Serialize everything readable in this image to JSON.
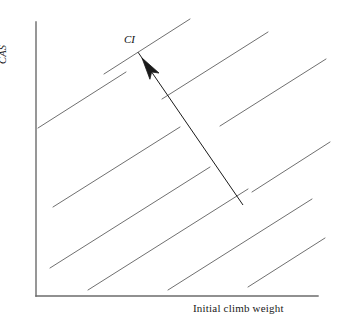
{
  "figure": {
    "background_color": "#ffffff",
    "width": 338,
    "height": 321
  },
  "axes": {
    "color": "#6b6b6b",
    "origin_x": 36,
    "origin_y": 296,
    "y_top": 22,
    "x_right": 318,
    "x_title": "Initial climb weight",
    "y_title": "CAS"
  },
  "annotation": {
    "label": "CI",
    "arrow_color": "#1a1a1a",
    "arrow_tail_x": 243,
    "arrow_tail_y": 205,
    "arrow_head_x": 142,
    "arrow_head_y": 58
  },
  "chart_data": {
    "type": "line",
    "title": "",
    "xlabel": "Initial climb weight",
    "ylabel": "CAS",
    "annotations": [
      {
        "text": "CI",
        "meaning": "arrow indicates direction of increasing Cost Index",
        "arrow_from": [
          243,
          205
        ],
        "arrow_to": [
          142,
          58
        ]
      }
    ],
    "grid": false,
    "legend": false,
    "axis_ticks": false,
    "xlim": [
      0,
      1
    ],
    "ylim": [
      0,
      1
    ],
    "series_description": "family of eight parallel straight lines of equal positive slope, each representing a constant Cost Index (CI); CI increases toward the upper-left along the arrow",
    "line_color": "#707070",
    "line_slope": -0.632,
    "series": [
      {
        "name": "CI line 1",
        "x": [
          38,
          125
        ],
        "y": [
          129,
          74
        ]
      },
      {
        "name": "CI line 2",
        "x": [
          48,
          178
        ],
        "y": [
          210,
          128
        ]
      },
      {
        "name": "CI line 3",
        "x": [
          54,
          205
        ],
        "y": [
          270,
          175
        ]
      },
      {
        "name": "CI line 4",
        "x": [
          88,
          243
        ],
        "y": [
          288,
          190
        ]
      },
      {
        "name": "CI line 5",
        "x": [
          119,
          300
        ],
        "y": [
          77,
          22
        ]
      },
      {
        "name": "CI line 6",
        "x": [
          168,
          311
        ],
        "y": [
          288,
          200
        ]
      },
      {
        "name": "CI line 7",
        "x": [
          200,
          325
        ],
        "y": [
          40,
          22
        ]
      },
      {
        "name": "CI line 8",
        "x": [
          248,
          324
        ],
        "y": [
          285,
          237
        ]
      }
    ],
    "lines_px": [
      {
        "x1": 38,
        "y1": 128,
        "x2": 126,
        "y2": 72
      },
      {
        "x1": 53,
        "y1": 207,
        "x2": 180,
        "y2": 127
      },
      {
        "x1": 50,
        "y1": 268,
        "x2": 210,
        "y2": 167
      },
      {
        "x1": 88,
        "y1": 290,
        "x2": 248,
        "y2": 189
      },
      {
        "x1": 168,
        "y1": 290,
        "x2": 312,
        "y2": 199
      },
      {
        "x1": 248,
        "y1": 287,
        "x2": 325,
        "y2": 238
      },
      {
        "x1": 104,
        "y1": 74,
        "x2": 190,
        "y2": 19
      },
      {
        "x1": 162,
        "y1": 99,
        "x2": 268,
        "y2": 32
      },
      {
        "x1": 220,
        "y1": 126,
        "x2": 326,
        "y2": 59
      },
      {
        "x1": 252,
        "y1": 192,
        "x2": 330,
        "y2": 142
      }
    ]
  }
}
